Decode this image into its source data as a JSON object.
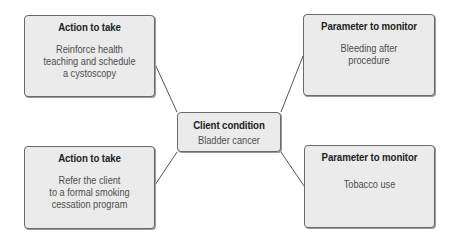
{
  "diagram": {
    "center": {
      "title": "Client condition",
      "body": "Bladder cancer"
    },
    "top_left": {
      "title": "Action to take",
      "body": "Reinforce health\nteaching and schedule\na cystoscopy"
    },
    "top_right": {
      "title": "Parameter to monitor",
      "body": "Bleeding after\nprocedure"
    },
    "bottom_left": {
      "title": "Action to take",
      "body": "Refer the client\nto a formal smoking\ncessation program"
    },
    "bottom_right": {
      "title": "Parameter to monitor",
      "body": "Tobacco use"
    },
    "colors": {
      "box_fill": "#ebebeb",
      "box_border": "#6a6a6a",
      "title_text": "#222222",
      "body_text": "#4e4e4e",
      "connector": "#555555"
    }
  }
}
